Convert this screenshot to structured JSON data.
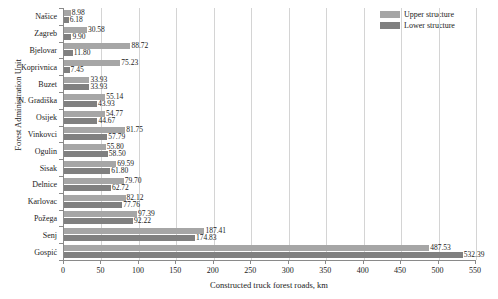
{
  "chart_data": {
    "type": "bar",
    "orientation": "horizontal",
    "title": "",
    "xlabel": "Constructed truck forest roads, km",
    "ylabel": "Forest Administration Unit",
    "xlim": [
      0,
      550
    ],
    "xticks": [
      0,
      50,
      100,
      150,
      200,
      250,
      300,
      350,
      400,
      450,
      500,
      550
    ],
    "grid": true,
    "legend_position": "top-right",
    "categories": [
      "Našice",
      "Zagreb",
      "Bjelovar",
      "Koprivnica",
      "Buzet",
      "N. Gradiška",
      "Osijek",
      "Vinkovci",
      "Ogulin",
      "Sisak",
      "Delnice",
      "Karlovac",
      "Požega",
      "Senj",
      "Gospić"
    ],
    "series": [
      {
        "name": "Upper structure",
        "color": "#a6a6a6",
        "values": [
          8.98,
          30.58,
          88.72,
          75.23,
          33.93,
          55.14,
          54.77,
          81.75,
          55.8,
          69.59,
          79.7,
          82.12,
          97.39,
          187.41,
          487.53
        ],
        "labels": [
          "8.98",
          "30.58",
          "88.72",
          "75.23",
          "33.93",
          "55.14",
          "54.77",
          "81.75",
          "55.80",
          "69.59",
          "79.70",
          "82.12",
          "97.39",
          "187.41",
          "487.53"
        ]
      },
      {
        "name": "Lower structure",
        "color": "#808080",
        "values": [
          6.18,
          9.9,
          11.8,
          7.45,
          33.93,
          43.93,
          44.67,
          57.79,
          58.5,
          61.8,
          62.72,
          77.76,
          92.22,
          174.83,
          532.39
        ],
        "labels": [
          "6.18",
          "9.90",
          "11.80",
          "7.45",
          "33.93",
          "43.93",
          "44.67",
          "57.79",
          "58.50",
          "61.80",
          "62.72",
          "77.76",
          "92.22",
          "174.83",
          "532.39"
        ]
      }
    ]
  },
  "legend": {
    "items": [
      {
        "label": "Upper structure",
        "color": "#a6a6a6"
      },
      {
        "label": "Lower structure",
        "color": "#808080"
      }
    ]
  }
}
